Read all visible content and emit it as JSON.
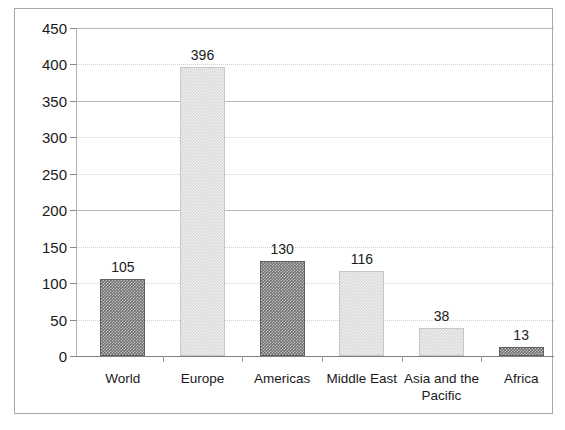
{
  "chart_data": {
    "type": "bar",
    "title": "",
    "subtitle": "",
    "xlabel": "",
    "ylabel": "",
    "ylim": [
      0,
      450
    ],
    "ytick_step": 50,
    "yticks": [
      0,
      50,
      100,
      150,
      200,
      250,
      300,
      350,
      400,
      450
    ],
    "grid": true,
    "grid_axis": "y",
    "legend": false,
    "categories": [
      "World",
      "Europe",
      "Americas",
      "Middle East",
      "Asia and the Pacific",
      "Africa"
    ],
    "values": [
      105,
      396,
      130,
      116,
      38,
      13
    ],
    "value_labels": [
      "105",
      "396",
      "130",
      "116",
      "38",
      "13"
    ],
    "bar_styles": [
      "dark",
      "light",
      "dark",
      "light",
      "light",
      "dark"
    ],
    "colors": {
      "bar_dark": "#6f6f6f",
      "bar_light": "#d8d8d8",
      "gridline_solid": "#b9b9b9",
      "gridline_dotted": "#cfcfcf",
      "axis": "#808080",
      "frame_border": "#a8a8a8",
      "text": "#1a1a1a",
      "background": "#ffffff"
    }
  },
  "axis": {
    "y_tick_labels": [
      "450",
      "400",
      "350",
      "300",
      "250",
      "200",
      "150",
      "100",
      "50",
      "0"
    ],
    "y_gridline_styles": [
      "solid",
      "dotted",
      "solid",
      "dotted",
      "dotted",
      "solid",
      "dotted",
      "dotted",
      "dotted",
      "solid"
    ]
  },
  "category_labels": [
    {
      "line1": "World",
      "line2": ""
    },
    {
      "line1": "Europe",
      "line2": ""
    },
    {
      "line1": "Americas",
      "line2": ""
    },
    {
      "line1": "Middle East",
      "line2": ""
    },
    {
      "line1": "Asia and the",
      "line2": "Pacific"
    },
    {
      "line1": "Africa",
      "line2": ""
    }
  ]
}
